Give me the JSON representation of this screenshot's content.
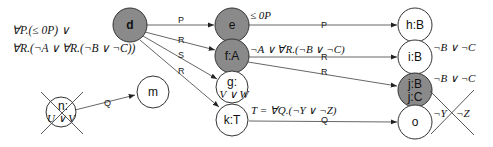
{
  "diagram": {
    "colors": {
      "filled_node": "#8a8a8a",
      "empty_node": "#ffffff",
      "stroke": "#333333",
      "edge": "#444444"
    },
    "root_formula": {
      "line1": "∀P.(≤ 0P) ∨",
      "line2": "∀R.(¬A ∨ ∀R.(¬B ∨ ¬C))"
    },
    "nodes": {
      "d": {
        "label": "d",
        "filled": true
      },
      "e": {
        "label": "e",
        "filled": true,
        "annotation": "≤ 0P"
      },
      "fA": {
        "label": "f:A",
        "filled": true,
        "annotation": "¬A ∨ ∀R.(¬B ∨ ¬C)"
      },
      "g": {
        "label": "g:",
        "sublabel": "V ∨ W",
        "filled": false
      },
      "kT": {
        "label": "k:T",
        "filled": false,
        "annotation": "T = ∀Q.(¬Y ∨ ¬Z)"
      },
      "n": {
        "label": "n:",
        "sublabel": "U ∨ V",
        "filled": false,
        "crossed": true
      },
      "m": {
        "label": "m",
        "filled": false
      },
      "hB": {
        "label": "h:B",
        "filled": false
      },
      "iB": {
        "label": "i:B",
        "filled": false,
        "annotation": "¬B ∨ ¬C"
      },
      "j": {
        "label": "j:B",
        "sublabel": "j:C",
        "filled": true,
        "annotation": "¬B ∨ ¬C"
      },
      "o": {
        "label": "o",
        "filled": false,
        "annotation_left": "¬Y",
        "annotation_right": "¬Z",
        "crossed_annotation": true
      }
    },
    "edges": [
      {
        "from": "d",
        "to": "e",
        "label": "P"
      },
      {
        "from": "d",
        "to": "f:A",
        "label": "R"
      },
      {
        "from": "d",
        "to": "g",
        "label": "S"
      },
      {
        "from": "d",
        "to": "k:T",
        "label": "R"
      },
      {
        "from": "n",
        "to": "m",
        "label": "Q"
      },
      {
        "from": "e",
        "to": "h:B",
        "label": "P"
      },
      {
        "from": "f:A",
        "to": "i:B",
        "label": "R"
      },
      {
        "from": "f:A",
        "to": "j",
        "label": "R"
      },
      {
        "from": "k:T",
        "to": "o",
        "label": "Q"
      }
    ]
  }
}
